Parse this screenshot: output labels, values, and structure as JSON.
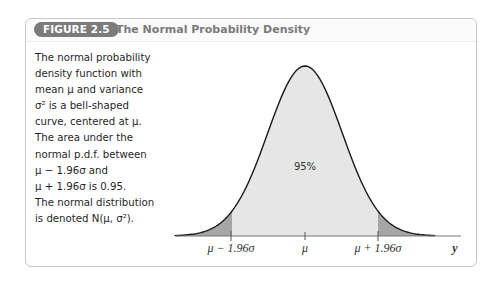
{
  "figure": {
    "badge": "FIGURE 2.5",
    "title": "The Normal Probability Density"
  },
  "caption": {
    "lines": [
      "The normal probability",
      "density function with",
      "mean μ and variance",
      "σ² is a bell-shaped",
      "curve, centered at μ.",
      "The area under the",
      "normal p.d.f. between",
      "μ − 1.96σ and",
      "μ + 1.96σ  is 0.95.",
      "The normal distribution",
      "is denoted N(μ, σ²)."
    ]
  },
  "chart_data": {
    "type": "area",
    "title": "The Normal Probability Density",
    "xlabel": "y",
    "ylabel": "",
    "x_ticks": [
      "μ − 1.96σ",
      "μ",
      "μ + 1.96σ"
    ],
    "x_tick_positions_sigma": [
      -1.96,
      0,
      1.96
    ],
    "xlim_sigma": [
      -3.5,
      3.5
    ],
    "regions": [
      {
        "name": "left tail",
        "from": "-inf",
        "to": -1.96,
        "area": 0.025,
        "fill": "#a6a6a6"
      },
      {
        "name": "central",
        "from": -1.96,
        "to": 1.96,
        "area": 0.95,
        "label": "95%",
        "fill": "#e6e6e6"
      },
      {
        "name": "right tail",
        "from": 1.96,
        "to": "inf",
        "area": 0.025,
        "fill": "#a6a6a6"
      }
    ],
    "annotation": "95%",
    "grid": false,
    "legend": null,
    "colors": {
      "curve": "#1a1a1a",
      "central": "#e6e6e6",
      "tails": "#a6a6a6",
      "axis": "#777777"
    }
  },
  "labels": {
    "area": "95%",
    "tick_left": "μ − 1.96σ",
    "tick_center": "μ",
    "tick_right": "μ + 1.96σ",
    "axis_var": "y"
  }
}
